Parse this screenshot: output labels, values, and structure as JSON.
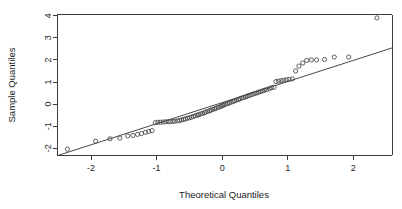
{
  "chart_data": {
    "type": "scatter",
    "title": "",
    "xlabel": "Theoretical Quantiles",
    "ylabel": "Sample Quantiles",
    "xlim": [
      -2.72,
      2.82
    ],
    "ylim": [
      -2.47,
      4.15
    ],
    "grid": false,
    "legend": null,
    "xticks": [
      -2,
      -1,
      0,
      1,
      2
    ],
    "xticklabels": [
      "-2",
      "-1",
      "0",
      "1",
      "2"
    ],
    "yticks": [
      -2,
      -1,
      0,
      1,
      2,
      3,
      4
    ],
    "yticklabels": [
      "-2",
      "-1",
      "0",
      "1",
      "2",
      "3",
      "4"
    ],
    "point_marker": "open-circle",
    "point_radius_px": 2.1,
    "reference_line": {
      "name": "qqline",
      "x": [
        -2.5,
        2.6
      ],
      "y": [
        -2.32,
        2.55
      ]
    },
    "series": [
      {
        "name": "Sample vs Theoretical Quantiles",
        "x": [
          -2.36,
          -1.93,
          -1.71,
          -1.56,
          -1.44,
          -1.36,
          -1.29,
          -1.23,
          -1.17,
          -1.12,
          -1.07,
          -1.02,
          -0.98,
          -0.94,
          -0.9,
          -0.86,
          -0.82,
          -0.79,
          -0.75,
          -0.72,
          -0.68,
          -0.65,
          -0.62,
          -0.59,
          -0.56,
          -0.53,
          -0.5,
          -0.47,
          -0.44,
          -0.41,
          -0.38,
          -0.36,
          -0.33,
          -0.3,
          -0.27,
          -0.25,
          -0.22,
          -0.19,
          -0.17,
          -0.14,
          -0.11,
          -0.09,
          -0.06,
          -0.03,
          -0.01,
          0.01,
          0.03,
          0.06,
          0.09,
          0.11,
          0.14,
          0.17,
          0.19,
          0.22,
          0.25,
          0.27,
          0.3,
          0.33,
          0.36,
          0.38,
          0.41,
          0.44,
          0.47,
          0.5,
          0.53,
          0.56,
          0.59,
          0.62,
          0.65,
          0.68,
          0.72,
          0.75,
          0.79,
          0.82,
          0.86,
          0.9,
          0.94,
          0.98,
          1.02,
          1.07,
          1.12,
          1.17,
          1.23,
          1.29,
          1.36,
          1.44,
          1.56,
          1.71,
          1.93,
          2.36
        ],
        "y": [
          -2.04,
          -1.68,
          -1.57,
          -1.54,
          -1.44,
          -1.42,
          -1.37,
          -1.33,
          -1.28,
          -1.24,
          -1.2,
          -0.84,
          -0.82,
          -0.82,
          -0.81,
          -0.8,
          -0.8,
          -0.79,
          -0.78,
          -0.77,
          -0.76,
          -0.74,
          -0.72,
          -0.69,
          -0.67,
          -0.64,
          -0.62,
          -0.59,
          -0.56,
          -0.53,
          -0.5,
          -0.48,
          -0.45,
          -0.42,
          -0.39,
          -0.36,
          -0.33,
          -0.3,
          -0.27,
          -0.24,
          -0.21,
          -0.18,
          -0.15,
          -0.12,
          -0.09,
          -0.06,
          -0.03,
          0.0,
          0.03,
          0.06,
          0.09,
          0.12,
          0.15,
          0.18,
          0.21,
          0.24,
          0.27,
          0.3,
          0.33,
          0.36,
          0.39,
          0.42,
          0.45,
          0.48,
          0.51,
          0.54,
          0.57,
          0.6,
          0.63,
          0.66,
          0.7,
          0.74,
          0.76,
          1.02,
          1.04,
          1.06,
          1.08,
          1.1,
          1.12,
          1.14,
          1.5,
          1.72,
          1.86,
          1.98,
          2.0,
          2.0,
          2.02,
          2.13,
          2.13,
          3.9
        ]
      }
    ]
  },
  "labels": {
    "x_axis_title": "Theoretical Quantiles",
    "y_axis_title": "Sample Quantiles"
  }
}
